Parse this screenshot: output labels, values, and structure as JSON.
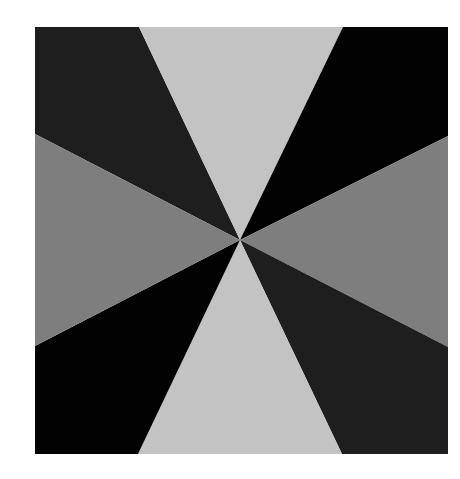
{
  "image": {
    "description": "Square pinwheel / starburst pattern of eight triangular wedges radiating from the center, in alternating grayscale tones",
    "background": "#ffffff",
    "square": {
      "x": 35,
      "y": 27,
      "width": 413,
      "height": 427
    },
    "center": {
      "x": 240,
      "y": 240
    },
    "colors": {
      "near_black": "#1e1e1e",
      "black": "#020202",
      "mid_gray": "#7e7e7e",
      "light_gray": "#c3c3c3"
    },
    "wedges": [
      {
        "name": "top-left",
        "color": "#1e1e1e",
        "points": "35,27 139,27 240,240 35,134"
      },
      {
        "name": "top",
        "color": "#c3c3c3",
        "points": "139,27 343,27 240,240"
      },
      {
        "name": "top-right",
        "color": "#020202",
        "points": "343,27 448,27 448,136 240,240"
      },
      {
        "name": "right",
        "color": "#7e7e7e",
        "points": "448,136 448,347 240,240"
      },
      {
        "name": "bottom-right",
        "color": "#1e1e1e",
        "points": "448,347 448,454 342,454 240,240"
      },
      {
        "name": "bottom",
        "color": "#c3c3c3",
        "points": "342,454 138,454 240,240"
      },
      {
        "name": "bottom-left",
        "color": "#020202",
        "points": "138,454 35,454 35,346 240,240"
      },
      {
        "name": "left",
        "color": "#7e7e7e",
        "points": "35,346 35,134 240,240"
      }
    ]
  }
}
